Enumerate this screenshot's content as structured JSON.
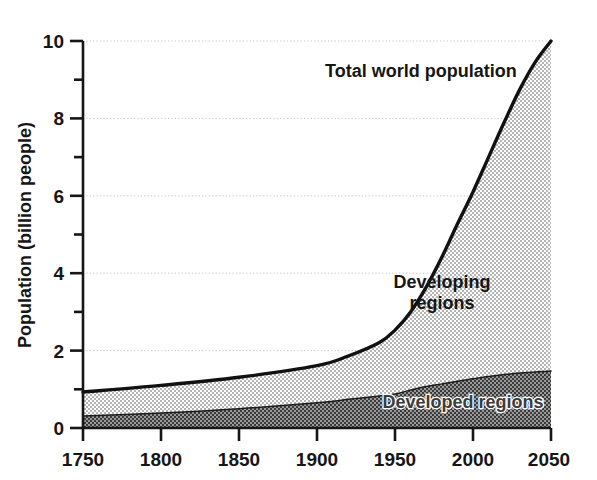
{
  "chart_data": {
    "type": "area",
    "title": "",
    "xlabel": "",
    "ylabel": "Population (billion people)",
    "xlim": [
      1750,
      2050
    ],
    "ylim": [
      0,
      10
    ],
    "grid": true,
    "gridlines_y": [
      2,
      4,
      6,
      8,
      10
    ],
    "legend_position": "in-plot annotations",
    "xticks": [
      1750,
      1800,
      1850,
      1900,
      1950,
      2000,
      2050
    ],
    "xtick_labels": [
      "1750",
      "1800",
      "1850",
      "1900",
      "1950",
      "2000",
      "2050"
    ],
    "yticks": [
      0,
      1,
      2,
      3,
      4,
      5,
      6,
      7,
      8,
      9,
      10
    ],
    "ytick_labels_major": [
      "0",
      "2",
      "4",
      "6",
      "8",
      "10"
    ],
    "x": [
      1750,
      1800,
      1850,
      1900,
      1920,
      1940,
      1950,
      1960,
      1970,
      1980,
      1990,
      2000,
      2010,
      2020,
      2030,
      2040,
      2050
    ],
    "series": [
      {
        "name": "Developed regions",
        "values": [
          0.31,
          0.39,
          0.5,
          0.65,
          0.74,
          0.83,
          0.88,
          0.98,
          1.07,
          1.14,
          1.21,
          1.27,
          1.33,
          1.38,
          1.42,
          1.45,
          1.47
        ],
        "fill": "dark-dither",
        "label": "Developed regions"
      },
      {
        "name": "Developing regions",
        "values": [
          0.62,
          0.71,
          0.81,
          0.96,
          1.12,
          1.38,
          1.65,
          2.02,
          2.57,
          3.27,
          4.06,
          4.83,
          5.67,
          6.52,
          7.33,
          8.01,
          8.53
        ],
        "fill": "light-dither",
        "label": "Developing regions"
      }
    ],
    "total": {
      "name": "Total world population",
      "label": "Total world population",
      "values": [
        0.93,
        1.1,
        1.31,
        1.61,
        1.86,
        2.21,
        2.53,
        3.0,
        3.64,
        4.41,
        5.27,
        6.1,
        7.0,
        7.9,
        8.75,
        9.46,
        10.0
      ]
    },
    "annotations": [
      {
        "text": "Total world population",
        "x": 1910,
        "y": 8.9
      },
      {
        "text": "Developing regions",
        "x": 1990,
        "y": 4.2
      },
      {
        "text": "Developed regions",
        "x": 1995,
        "y": 0.75
      }
    ],
    "colors": {
      "axis": "#161616",
      "total_line": "#111111",
      "developing_fill": "#d2d2d2",
      "developed_fill": "#6e6e6e",
      "gridline": "#c9c9c9",
      "background": "#ffffff"
    }
  },
  "axis": {
    "y_title": "Population (billion people)",
    "y_labels": {
      "v0": "0",
      "v2": "2",
      "v4": "4",
      "v6": "6",
      "v8": "8",
      "v10": "10"
    },
    "x_labels": {
      "t1750": "1750",
      "t1800": "1800",
      "t1850": "1850",
      "t1900": "1900",
      "t1950": "1950",
      "t2000": "2000",
      "t2050": "2050"
    }
  },
  "labels": {
    "total": "Total world population",
    "developing_line1": "Developing",
    "developing_line2": "regions",
    "developed": "Developed regions"
  }
}
